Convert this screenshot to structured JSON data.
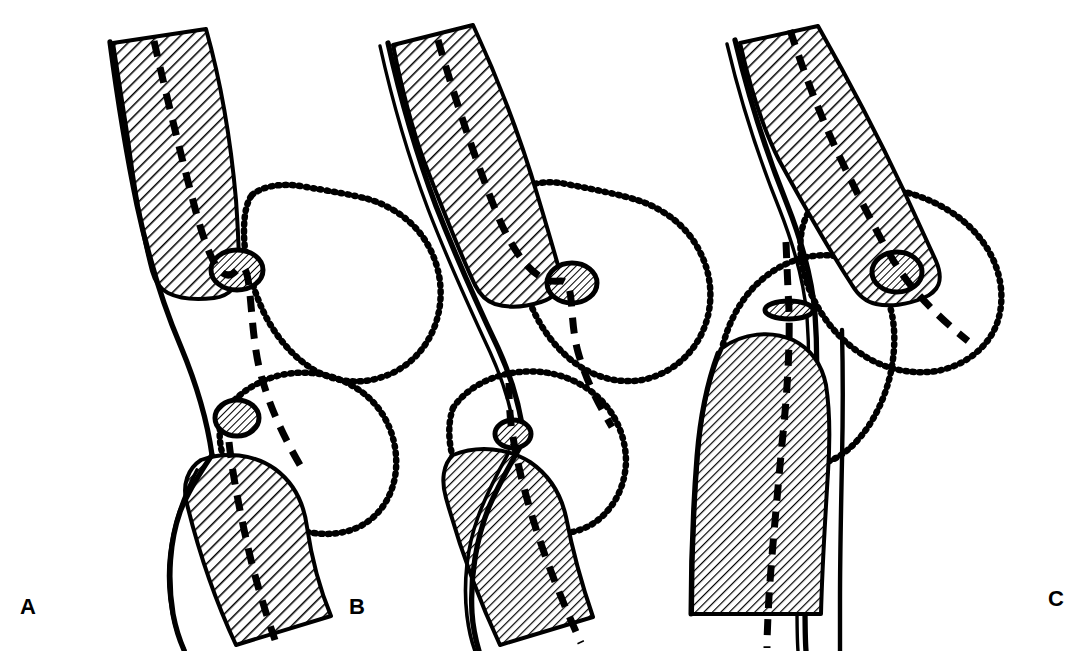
{
  "figure": {
    "background_color": "#ffffff",
    "ink_color": "#000000",
    "panel_count": 3
  },
  "panels": [
    {
      "id": "A",
      "label": "A",
      "description": "Flexed / valgus-angulated limb; femur and tibia shafts meet at an angled knee, patella shown twice (en-face ovals) along the dashed mechanical axis",
      "structures": {
        "femur_label": "femur-shaft-upper",
        "tibia_label": "tibia-shaft-lower",
        "patella_upper_label": "patella-upper",
        "patella_lower_label": "patella-lower",
        "soft_tissue_label": "soft-tissue-contour",
        "axis_label": "mechanical-axis"
      },
      "counts": {
        "hatched_bones": 2,
        "patellae": 2,
        "dotted_contours": 2
      }
    },
    {
      "id": "B",
      "label": "B",
      "description": "Partially corrected limb; bone shafts more closely aligned, patellae approach each other at the joint line",
      "structures": {
        "femur_label": "femur-shaft-upper",
        "tibia_label": "tibia-shaft-lower",
        "patella_upper_label": "patella-upper",
        "patella_lower_label": "patella-lower",
        "soft_tissue_label": "soft-tissue-contour",
        "axis_label": "mechanical-axis"
      },
      "counts": {
        "hatched_bones": 2,
        "patellae": 2,
        "dotted_contours": 2
      }
    },
    {
      "id": "C",
      "label": "C",
      "description": "Fully reduced / aligned limb; femur and tibia shafts are collinear with a straight continuous cortical line, patella seen edge-on as a thin flat oval",
      "structures": {
        "femur_label": "femur-shaft-upper",
        "tibia_label": "tibia-shaft-lower",
        "patella_upper_label": "patella-en-face",
        "patella_lower_label": "patella-edge-on",
        "soft_tissue_label": "soft-tissue-contour",
        "axis_label": "mechanical-axis"
      },
      "counts": {
        "hatched_bones": 2,
        "patellae": 2,
        "dotted_contours": 2
      }
    }
  ],
  "legend_keys": {
    "hatch_fill": "diagonal-hatch-bone",
    "dotted_line": "soft-tissue-outline",
    "dashed_line": "mechanical-axis-line",
    "solid_line": "cortical-bone-outline"
  },
  "style_tokens": {
    "line_color": "#000000",
    "fill_color": "#ffffff",
    "hatch_angle_degrees": 45,
    "label_font_weight": "bold"
  }
}
